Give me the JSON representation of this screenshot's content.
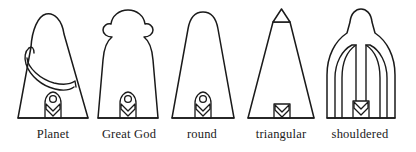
{
  "figure": {
    "background_color": "#ffffff",
    "line_color": "#1a1a1a",
    "width": 416,
    "height": 152,
    "baseline_y": 118,
    "caption_y": 128
  },
  "shapes": [
    {
      "id": "planet",
      "label": "Planet",
      "description": "tapered trapezoid body with rounded dome head and diagonal curved sash band",
      "label_center_x": 53,
      "features": [
        "dome-head",
        "sash-band",
        "niche"
      ]
    },
    {
      "id": "great-god",
      "label": "Great God",
      "description": "rounded dome head with scrolled volute shoulders over a tapered body",
      "label_center_x": 129,
      "features": [
        "dome-head",
        "volute-shoulders",
        "niche"
      ]
    },
    {
      "id": "round",
      "label": "round",
      "description": "plain tapered trapezoid with a rounded top",
      "label_center_x": 202,
      "features": [
        "rounded-top",
        "niche"
      ]
    },
    {
      "id": "triangular",
      "label": "triangular",
      "description": "tall tapered body capped by a small pointed triangular apex",
      "label_center_x": 281,
      "features": [
        "triangular-cap",
        "niche"
      ]
    },
    {
      "id": "shouldered",
      "label": "shouldered",
      "description": "narrow rounded column widening into broad shoulders with inner arched recesses",
      "label_center_x": 360,
      "features": [
        "rounded-column",
        "broad-shoulders",
        "inner-arches",
        "niche"
      ]
    }
  ],
  "niche": {
    "name": "niche-with-rosette-and-chevron",
    "description": "small arched niche containing a circular boss above a downward chevron"
  }
}
